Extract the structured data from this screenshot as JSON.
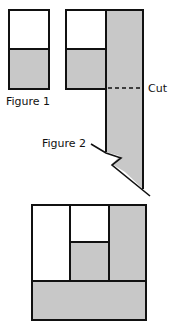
{
  "labels": {
    "figure1": "Figure 1",
    "figure2": "Figure 2",
    "cut": "Cut"
  },
  "colors": {
    "shade": "#c8c8c8",
    "line": "#111111",
    "background": "#ffffff"
  }
}
